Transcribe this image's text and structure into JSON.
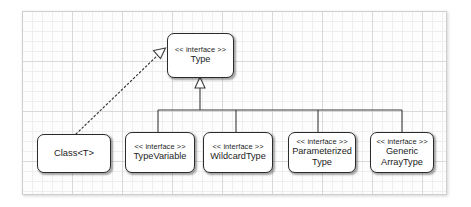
{
  "diagram": {
    "stereotype_label": "<< interface >>",
    "canvas": {
      "background": "#fdfdfd",
      "grid_minor_color": "#eeeeee",
      "grid_major_color": "#d9d9d9",
      "border_color": "#cfcfcf"
    },
    "node_style": {
      "fill": "#ffffff",
      "stroke": "#2b2b2b"
    },
    "nodes": [
      {
        "id": "type",
        "stereotype": "<< interface >>",
        "name": "Type",
        "kind": "interface",
        "lines": [
          "Type"
        ]
      },
      {
        "id": "class-t",
        "stereotype": "",
        "name": "Class<T>",
        "kind": "class",
        "lines": [
          "Class<T>"
        ]
      },
      {
        "id": "type-variable",
        "stereotype": "<< interface >>",
        "name": "TypeVariable",
        "kind": "interface",
        "lines": [
          "TypeVariable"
        ]
      },
      {
        "id": "wildcard-type",
        "stereotype": "<< interface >>",
        "name": "WildcardType",
        "kind": "interface",
        "lines": [
          "WildcardType"
        ]
      },
      {
        "id": "parameterized-type",
        "stereotype": "<< interface >>",
        "name": "ParameterizedType",
        "kind": "interface",
        "lines": [
          "Parameterized",
          "Type"
        ]
      },
      {
        "id": "generic-array-type",
        "stereotype": "<< interface >>",
        "name": "GenericArrayType",
        "kind": "interface",
        "lines": [
          "Generic",
          "ArrayType"
        ]
      }
    ],
    "edges": [
      {
        "from": "class-t",
        "to": "type",
        "type": "realization",
        "line": "dotted",
        "arrowhead": "hollow-triangle"
      },
      {
        "from": "type-variable",
        "to": "type",
        "type": "generalization",
        "line": "solid",
        "arrowhead": "hollow-triangle"
      },
      {
        "from": "wildcard-type",
        "to": "type",
        "type": "generalization",
        "line": "solid",
        "arrowhead": "hollow-triangle"
      },
      {
        "from": "parameterized-type",
        "to": "type",
        "type": "generalization",
        "line": "solid",
        "arrowhead": "hollow-triangle"
      },
      {
        "from": "generic-array-type",
        "to": "type",
        "type": "generalization",
        "line": "solid",
        "arrowhead": "hollow-triangle"
      }
    ]
  }
}
